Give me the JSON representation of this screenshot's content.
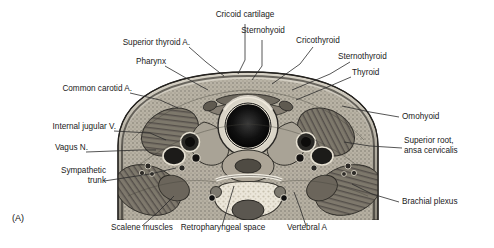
{
  "figure": {
    "panel_tag": "(A)",
    "caption_region": "transverse section of the neck at the level of the cricoid cartilage"
  },
  "labels": {
    "top": [
      {
        "id": "cricoid-cartilage",
        "text": "Cricoid cartilage"
      },
      {
        "id": "sternohyoid",
        "text": "Sternohyoid"
      },
      {
        "id": "cricothyroid",
        "text": "Cricothyroid"
      },
      {
        "id": "sternothyroid",
        "text": "Sternothyroid"
      },
      {
        "id": "thyroid",
        "text": "Thyroid"
      },
      {
        "id": "superior-thyroid-artery",
        "text": "Superior thyroid A."
      },
      {
        "id": "pharynx",
        "text": "Pharynx"
      }
    ],
    "left": [
      {
        "id": "common-carotid-artery",
        "text": "Common carotid A."
      },
      {
        "id": "internal-jugular-vein",
        "text": "Internal jugular V."
      },
      {
        "id": "vagus-nerve",
        "text": "Vagus N."
      },
      {
        "id": "sympathetic-trunk",
        "text": "Sympathetic\ntrunk"
      }
    ],
    "right": [
      {
        "id": "omohyoid",
        "text": "Omohyoid"
      },
      {
        "id": "superior-root-ansa-cervicalis",
        "text": "Superior root,\nansa cervicalis"
      },
      {
        "id": "brachial-plexus",
        "text": "Brachial plexus"
      }
    ],
    "bottom": [
      {
        "id": "scalene-muscles",
        "text": "Scalene muscles"
      },
      {
        "id": "retropharyngeal-space",
        "text": "Retropharyngeal space"
      },
      {
        "id": "vertebral-artery",
        "text": "Vertebral A"
      }
    ]
  },
  "colors": {
    "text": "#1a1a1a",
    "leader_line": "#2b2b2b",
    "background": "#ffffff",
    "tissue_light": "#efece4",
    "tissue_mid": "#b9b3a6",
    "tissue_dark": "#4a4740",
    "lumen_black": "#0d0d0d"
  }
}
